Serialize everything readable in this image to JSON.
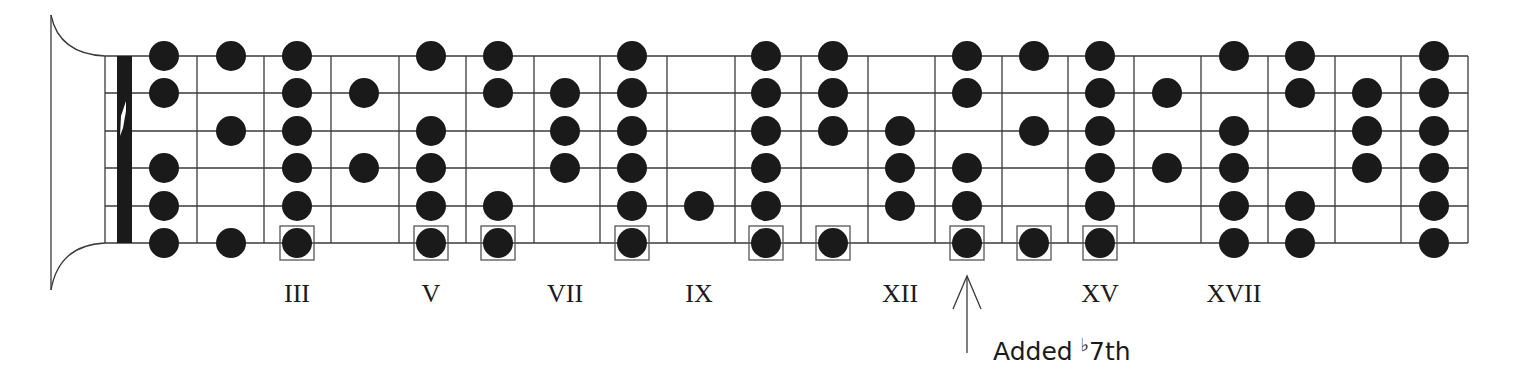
{
  "diagram": {
    "colors": {
      "line": "#3a3a3a",
      "dot": "#1a1a1a",
      "box": "#555555",
      "nut": "#1a1a1a",
      "background": "#ffffff"
    },
    "strings_count": 6,
    "string_y": [
      56,
      93,
      131,
      168,
      206,
      243
    ],
    "fret_x": [
      105,
      197,
      264,
      331,
      399,
      466,
      534,
      600,
      667,
      735,
      801,
      868,
      935,
      1002,
      1068,
      1134,
      1201,
      1268,
      1335,
      1401,
      1468
    ],
    "nut": {
      "x": 117,
      "width": 15
    },
    "headstock": {
      "x": 51,
      "top": 15,
      "bottom": 290
    },
    "dot_radius": 15,
    "columns": [
      {
        "fret": 1,
        "x": 164,
        "dots": [
          1,
          2,
          4,
          5,
          6
        ],
        "boxed": []
      },
      {
        "fret": 2,
        "x": 231,
        "dots": [
          1,
          3,
          6
        ],
        "boxed": []
      },
      {
        "fret": 3,
        "x": 297,
        "dots": [
          1,
          2,
          3,
          4,
          5,
          6
        ],
        "boxed": [
          6
        ]
      },
      {
        "fret": 4,
        "x": 364,
        "dots": [
          2,
          4
        ],
        "boxed": []
      },
      {
        "fret": 5,
        "x": 431,
        "dots": [
          1,
          3,
          4,
          5,
          6
        ],
        "boxed": [
          6
        ]
      },
      {
        "fret": 6,
        "x": 498,
        "dots": [
          1,
          2,
          5,
          6
        ],
        "boxed": [
          6
        ]
      },
      {
        "fret": 7,
        "x": 565,
        "dots": [
          2,
          3,
          4
        ],
        "boxed": []
      },
      {
        "fret": 8,
        "x": 632,
        "dots": [
          1,
          2,
          3,
          4,
          5,
          6
        ],
        "boxed": [
          6
        ]
      },
      {
        "fret": 9,
        "x": 699,
        "dots": [
          5
        ],
        "boxed": []
      },
      {
        "fret": 10,
        "x": 766,
        "dots": [
          1,
          2,
          3,
          4,
          5,
          6
        ],
        "boxed": [
          6
        ]
      },
      {
        "fret": 11,
        "x": 833,
        "dots": [
          1,
          2,
          3,
          6
        ],
        "boxed": [
          6
        ]
      },
      {
        "fret": 12,
        "x": 900,
        "dots": [
          3,
          4,
          5
        ],
        "boxed": []
      },
      {
        "fret": 13,
        "x": 967,
        "dots": [
          1,
          2,
          4,
          5,
          6
        ],
        "boxed": [
          6
        ]
      },
      {
        "fret": 14,
        "x": 1034,
        "dots": [
          1,
          3,
          6
        ],
        "boxed": [
          6
        ]
      },
      {
        "fret": 15,
        "x": 1100,
        "dots": [
          1,
          2,
          3,
          4,
          5,
          6
        ],
        "boxed": [
          6
        ]
      },
      {
        "fret": 16,
        "x": 1167,
        "dots": [
          2,
          4
        ],
        "boxed": []
      },
      {
        "fret": 17,
        "x": 1234,
        "dots": [
          1,
          3,
          4,
          5,
          6
        ],
        "boxed": []
      },
      {
        "fret": 18,
        "x": 1300,
        "dots": [
          1,
          2,
          5,
          6
        ],
        "boxed": []
      },
      {
        "fret": 19,
        "x": 1367,
        "dots": [
          2,
          3,
          4
        ],
        "boxed": []
      },
      {
        "fret": 20,
        "x": 1434,
        "dots": [
          1,
          2,
          3,
          4,
          5,
          6
        ],
        "boxed": []
      }
    ],
    "fret_markers": [
      {
        "label": "III",
        "x": 297
      },
      {
        "label": "V",
        "x": 431
      },
      {
        "label": "VII",
        "x": 565
      },
      {
        "label": "IX",
        "x": 699
      },
      {
        "label": "XII",
        "x": 900
      },
      {
        "label": "XV",
        "x": 1100
      },
      {
        "label": "XVII",
        "x": 1234
      }
    ],
    "annotation": {
      "arrow_x": 967,
      "arrow_top": 276,
      "arrow_bottom": 353,
      "text_prefix": "Added ",
      "flat": "♭",
      "text_suffix": "7th",
      "text_x": 993,
      "text_y": 360
    }
  }
}
